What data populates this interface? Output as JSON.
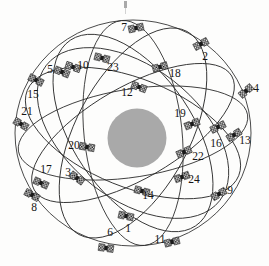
{
  "figure": {
    "type": "satellite-constellation-diagram",
    "title": "",
    "central_body": {
      "name": "earth-disc",
      "color": "#a9a9a9",
      "cx": 137,
      "cy": 138,
      "r": 29.5
    },
    "outline": {
      "name": "constellation-sphere",
      "color": "#262626",
      "cx": 133,
      "cy": 133,
      "rx": 118,
      "ry": 113
    },
    "colors": {
      "orbit_stroke": "#2b2b2b",
      "satellite_ink": "#1a1a1a",
      "satellite_fill": "#d8d8d8",
      "label_ink": "#151515",
      "earth": "#a9a9a9",
      "background": "#fdfdfc"
    },
    "orbits": [
      {
        "id": "orbit-1",
        "rx": 118,
        "ry": 113,
        "rot": 0
      },
      {
        "id": "orbit-2",
        "rx": 116,
        "ry": 44,
        "rot": -9
      },
      {
        "id": "orbit-3",
        "rx": 114,
        "ry": 54,
        "rot": 22
      },
      {
        "id": "orbit-4",
        "rx": 112,
        "ry": 60,
        "rot": 56
      },
      {
        "id": "orbit-5",
        "rx": 113,
        "ry": 49,
        "rot": 84
      },
      {
        "id": "orbit-6",
        "rx": 115,
        "ry": 57,
        "rot": 118
      },
      {
        "id": "orbit-7",
        "rx": 114,
        "ry": 46,
        "rot": 150
      },
      {
        "id": "orbit-8",
        "rx": 110,
        "ry": 66,
        "rot": 38
      }
    ],
    "satellites": [
      {
        "label": "1",
        "sx": 126,
        "sy": 216,
        "lx": 128,
        "ly": 232,
        "rot": 12
      },
      {
        "label": "2",
        "sx": 201,
        "sy": 44,
        "lx": 205,
        "ly": 60,
        "rot": -28
      },
      {
        "label": "3",
        "sx": 77,
        "sy": 178,
        "lx": 68,
        "ly": 176,
        "rot": 35
      },
      {
        "label": "4",
        "sx": 246,
        "sy": 91,
        "lx": 256,
        "ly": 92,
        "rot": -40
      },
      {
        "label": "5",
        "sx": 62,
        "sy": 72,
        "lx": 50,
        "ly": 73,
        "rot": 22
      },
      {
        "label": "6",
        "sx": 106,
        "sy": 248,
        "lx": 110,
        "ly": 236,
        "rot": 8
      },
      {
        "label": "7",
        "sx": 136,
        "sy": 28,
        "lx": 124,
        "ly": 31,
        "rot": -12
      },
      {
        "label": "8",
        "sx": 32,
        "sy": 195,
        "lx": 34,
        "ly": 211,
        "rot": 28
      },
      {
        "label": "9",
        "sx": 219,
        "sy": 194,
        "lx": 230,
        "ly": 194,
        "rot": -30
      },
      {
        "label": "10",
        "sx": 73,
        "sy": 67,
        "lx": 83,
        "ly": 69,
        "rot": 18
      },
      {
        "label": "11",
        "sx": 172,
        "sy": 242,
        "lx": 160,
        "ly": 243,
        "rot": -14
      },
      {
        "label": "12",
        "sx": 139,
        "sy": 87,
        "lx": 127,
        "ly": 96,
        "rot": 20
      },
      {
        "label": "13",
        "sx": 234,
        "sy": 135,
        "lx": 245,
        "ly": 144,
        "rot": -32
      },
      {
        "label": "14",
        "sx": 142,
        "sy": 191,
        "lx": 148,
        "ly": 199,
        "rot": 15
      },
      {
        "label": "15",
        "sx": 36,
        "sy": 80,
        "lx": 33,
        "ly": 98,
        "rot": 26
      },
      {
        "label": "16",
        "sx": 218,
        "sy": 127,
        "lx": 216,
        "ly": 147,
        "rot": -26
      },
      {
        "label": "17",
        "sx": 41,
        "sy": 183,
        "lx": 46,
        "ly": 173,
        "rot": 24
      },
      {
        "label": "18",
        "sx": 160,
        "sy": 67,
        "lx": 175,
        "ly": 77,
        "rot": -16
      },
      {
        "label": "19",
        "sx": 192,
        "sy": 124,
        "lx": 180,
        "ly": 117,
        "rot": -22
      },
      {
        "label": "20",
        "sx": 87,
        "sy": 147,
        "lx": 74,
        "ly": 149,
        "rot": 10
      },
      {
        "label": "21",
        "sx": 21,
        "sy": 124,
        "lx": 27,
        "ly": 115,
        "rot": 30
      },
      {
        "label": "22",
        "sx": 184,
        "sy": 152,
        "lx": 198,
        "ly": 160,
        "rot": -24
      },
      {
        "label": "23",
        "sx": 102,
        "sy": 58,
        "lx": 113,
        "ly": 71,
        "rot": 14
      },
      {
        "label": "24",
        "sx": 182,
        "sy": 177,
        "lx": 194,
        "ly": 183,
        "rot": -20
      }
    ]
  }
}
